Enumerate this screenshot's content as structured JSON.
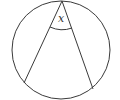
{
  "diagram": {
    "type": "inscribed-angle",
    "angle_label": "x",
    "stroke_color": "#3a3a3a",
    "circle": {
      "cx": 61,
      "cy": 50,
      "r": 49
    },
    "vertex": {
      "x": 62,
      "y": 1
    },
    "chord_ends": [
      {
        "x": 24,
        "y": 83
      },
      {
        "x": 93,
        "y": 89
      }
    ]
  }
}
